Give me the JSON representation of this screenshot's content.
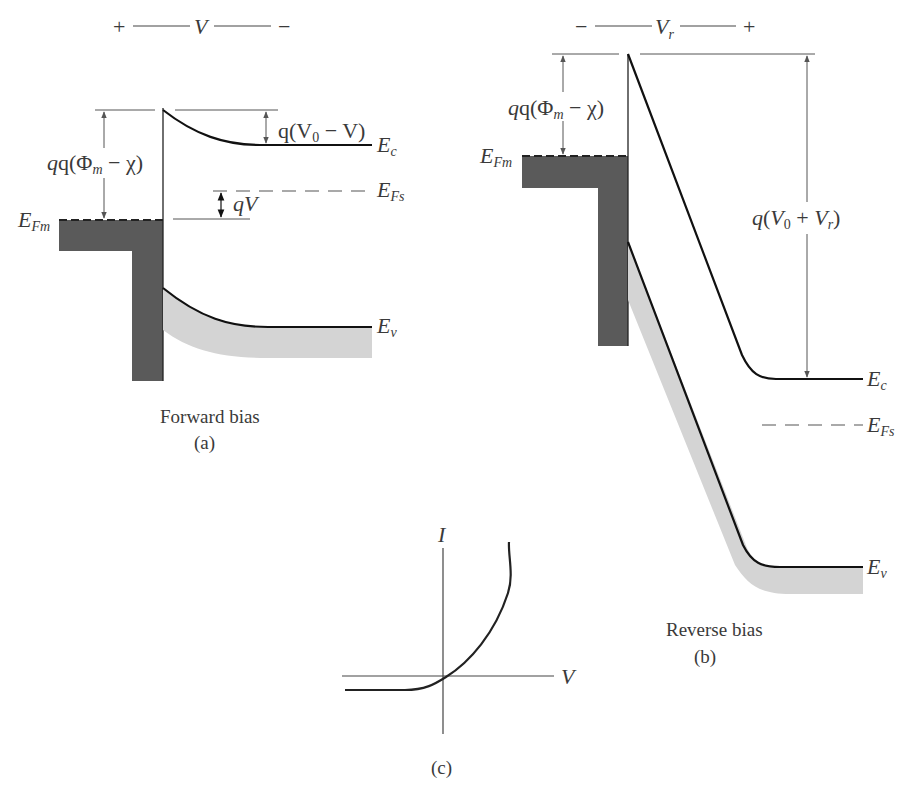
{
  "figure": {
    "panel_a": {
      "caption": "Forward bias",
      "tag": "(a)",
      "bias_label": {
        "left": "+",
        "var": "V",
        "right": "−"
      },
      "labels": {
        "barrier_metal_pre": "q(Φ",
        "barrier_metal_sub": "m",
        "barrier_metal_post": " − χ)",
        "barrier_semi_pre": "q(V",
        "barrier_semi_sub": "0",
        "barrier_semi_post": " − V)",
        "qV": "qV",
        "Ec": "E",
        "Ec_sub": "c",
        "Ev": "E",
        "Ev_sub": "v",
        "EFs": "E",
        "EFs_sub": "Fs",
        "EFm": "E",
        "EFm_sub": "Fm"
      }
    },
    "panel_b": {
      "caption": "Reverse bias",
      "tag": "(b)",
      "bias_label": {
        "left": "−",
        "var": "V",
        "var_sub": "r",
        "right": "+"
      },
      "labels": {
        "barrier_metal_pre": "q(Φ",
        "barrier_metal_sub": "m",
        "barrier_metal_post": " − χ)",
        "barrier_semi_pre": "q(V",
        "barrier_semi_sub": "0",
        "barrier_semi_mid": " + V",
        "barrier_semi_sub2": "r",
        "barrier_semi_post": ")",
        "Ec": "E",
        "Ec_sub": "c",
        "Ev": "E",
        "Ev_sub": "v",
        "EFs": "E",
        "EFs_sub": "Fs",
        "EFm": "E",
        "EFm_sub": "Fm"
      }
    },
    "panel_c": {
      "tag": "(c)",
      "y_axis": "I",
      "x_axis": "V"
    },
    "colors": {
      "metal": "#5a5a5a",
      "valence_band": "#d4d4d4",
      "line": "#1a1a1a",
      "annotation": "#555555"
    }
  }
}
